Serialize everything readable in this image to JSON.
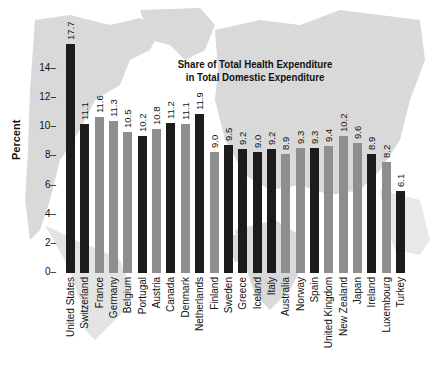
{
  "chart_data": {
    "type": "bar",
    "title": "Share of Total Health Expenditure in Total Domestic Expenditure",
    "title_lines": [
      "Share of Total Health Expenditure",
      "in Total Domestic Expenditure"
    ],
    "xlabel": "",
    "ylabel": "Percent",
    "ylim": [
      0,
      16
    ],
    "yticks": [
      0,
      2,
      4,
      6,
      8,
      10,
      12,
      14
    ],
    "grid": false,
    "legend": null,
    "background": "world map (light gray silhouette)",
    "categories": [
      "United States",
      "Switzerland",
      "France",
      "Germany",
      "Belgium",
      "Portugal",
      "Austria",
      "Canada",
      "Denmark",
      "Netherlands",
      "Finland",
      "Sweden",
      "Greece",
      "Iceland",
      "Italy",
      "Australia",
      "Norway",
      "Spain",
      "United Kingdom",
      "New Zealand",
      "Japan",
      "Ireland",
      "Luxembourg",
      "Turkey"
    ],
    "values": [
      17.7,
      11.1,
      11.6,
      11.3,
      10.5,
      10.2,
      10.8,
      11.2,
      11.1,
      11.9,
      9.0,
      9.5,
      9.2,
      9.0,
      9.2,
      8.9,
      9.3,
      9.3,
      9.4,
      10.2,
      9.6,
      8.9,
      8.2,
      6.1
    ],
    "value_labels": [
      "17.7",
      "11.1",
      "11.6",
      "11.3",
      "10.5",
      "10.2",
      "10.8",
      "11.2",
      "11.1",
      "11.9",
      "9.0",
      "9.5",
      "9.2",
      "9.0",
      "9.2",
      "8.9",
      "9.3",
      "9.3",
      "9.4",
      "10.2",
      "9.6",
      "8.9",
      "8.2",
      "6.1"
    ],
    "drawn_heights": [
      15.7,
      10.2,
      10.7,
      10.4,
      9.7,
      9.4,
      9.9,
      10.3,
      10.2,
      10.9,
      8.3,
      8.8,
      8.5,
      8.3,
      8.5,
      8.2,
      8.6,
      8.6,
      8.7,
      9.4,
      8.9,
      8.2,
      7.6,
      5.6
    ],
    "bar_shade": [
      "dark",
      "dark",
      "light",
      "light",
      "light",
      "dark",
      "light",
      "dark",
      "light",
      "dark",
      "light",
      "dark",
      "dark",
      "dark",
      "dark",
      "light",
      "light",
      "dark",
      "light",
      "light",
      "light",
      "dark",
      "light",
      "dark"
    ]
  },
  "colors": {
    "dark": "#1c1c1c",
    "light": "#8e8e8e",
    "map": "#d6d6d6",
    "text": "#111111"
  }
}
